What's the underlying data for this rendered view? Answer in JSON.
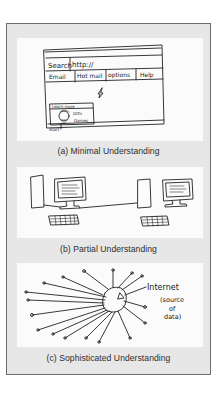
{
  "figure": {
    "panels": [
      {
        "id": "a",
        "caption": "(a) Minimal Understanding",
        "sketch": {
          "kind": "browser-window",
          "address_label": "Search",
          "address_value": "http://",
          "tabs": [
            "Email",
            "Hot mail",
            "options",
            "Help"
          ],
          "popup_title": "Learn more",
          "popup_text_1": "Gifts",
          "popup_text_2": "Games",
          "start_label": "start"
        }
      },
      {
        "id": "b",
        "caption": "(b) Partial Understanding",
        "sketch": {
          "kind": "two-connected-computers"
        }
      },
      {
        "id": "c",
        "caption": "(c) Sophisticated Understanding",
        "sketch": {
          "kind": "hub-network",
          "hub_label": "Internet",
          "hub_note_1": "(source",
          "hub_note_2": "of",
          "hub_note_3": "data)"
        }
      }
    ],
    "colors": {
      "frame_bg": "#e7e7e7",
      "frame_border": "#6d6d6d",
      "panel_bg": "#fbfbfb",
      "ink": "#222222",
      "caption_text": "#2e2e2e"
    }
  }
}
